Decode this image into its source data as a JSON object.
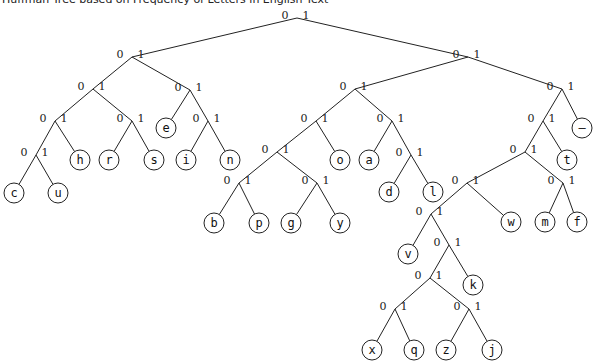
{
  "title": "Huffman Tree based on Frequency of Letters in English Text",
  "chart_data": {
    "type": "tree",
    "title": "Huffman Tree based on Frequency of Letters in English Text",
    "edge_labels": [
      "0",
      "1"
    ],
    "internal_nodes": [
      {
        "id": "root",
        "x": 297,
        "y": 18
      },
      {
        "id": "L",
        "x": 132,
        "y": 57
      },
      {
        "id": "R",
        "x": 468,
        "y": 57
      },
      {
        "id": "LL",
        "x": 93,
        "y": 89
      },
      {
        "id": "LR",
        "x": 190,
        "y": 90
      },
      {
        "id": "LLL",
        "x": 55,
        "y": 121
      },
      {
        "id": "LLR",
        "x": 132,
        "y": 121
      },
      {
        "id": "LLLL",
        "x": 36,
        "y": 155
      },
      {
        "id": "LRR",
        "x": 208,
        "y": 121
      },
      {
        "id": "RL",
        "x": 355,
        "y": 89
      },
      {
        "id": "RR",
        "x": 562,
        "y": 89
      },
      {
        "id": "RLL",
        "x": 316,
        "y": 121
      },
      {
        "id": "RLR",
        "x": 392,
        "y": 121
      },
      {
        "id": "RLLL",
        "x": 277,
        "y": 152
      },
      {
        "id": "RLLLL",
        "x": 239,
        "y": 183
      },
      {
        "id": "RLLLR",
        "x": 317,
        "y": 183
      },
      {
        "id": "RLRR",
        "x": 411,
        "y": 155
      },
      {
        "id": "RRL",
        "x": 543,
        "y": 121
      },
      {
        "id": "RRLL",
        "x": 525,
        "y": 152
      },
      {
        "id": "RRLLL",
        "x": 467,
        "y": 183
      },
      {
        "id": "RRLLR",
        "x": 563,
        "y": 183
      },
      {
        "id": "RRLLLL",
        "x": 431,
        "y": 214
      },
      {
        "id": "RRLLLLR",
        "x": 449,
        "y": 245
      },
      {
        "id": "RRLLLLRL",
        "x": 430,
        "y": 278
      },
      {
        "id": "RRLLLLRLL",
        "x": 395,
        "y": 309
      },
      {
        "id": "RRLLLLRLR",
        "x": 469,
        "y": 309
      }
    ],
    "leaves": [
      {
        "letter": "c",
        "code": "00000",
        "x": 14,
        "y": 193
      },
      {
        "letter": "u",
        "code": "00001",
        "x": 58,
        "y": 193
      },
      {
        "letter": "h",
        "code": "0001",
        "x": 80,
        "y": 160
      },
      {
        "letter": "r",
        "code": "0010",
        "x": 109,
        "y": 160
      },
      {
        "letter": "s",
        "code": "0011",
        "x": 154,
        "y": 160
      },
      {
        "letter": "e",
        "code": "010",
        "x": 166,
        "y": 128
      },
      {
        "letter": "i",
        "code": "0110",
        "x": 186,
        "y": 160
      },
      {
        "letter": "n",
        "code": "0111",
        "x": 230,
        "y": 160
      },
      {
        "letter": "b",
        "code": "100000",
        "x": 214,
        "y": 223
      },
      {
        "letter": "p",
        "code": "100001",
        "x": 259,
        "y": 223
      },
      {
        "letter": "g",
        "code": "100010",
        "x": 291,
        "y": 223
      },
      {
        "letter": "y",
        "code": "100011",
        "x": 340,
        "y": 223
      },
      {
        "letter": "o",
        "code": "1001",
        "x": 340,
        "y": 160
      },
      {
        "letter": "a",
        "code": "1010",
        "x": 369,
        "y": 160
      },
      {
        "letter": "d",
        "code": "10110",
        "x": 389,
        "y": 192
      },
      {
        "letter": "l",
        "code": "10111",
        "x": 433,
        "y": 192
      },
      {
        "letter": "v",
        "code": "110000",
        "x": 408,
        "y": 254
      },
      {
        "letter": "x",
        "code": "110001000",
        "x": 372,
        "y": 350
      },
      {
        "letter": "q",
        "code": "110001001",
        "x": 414,
        "y": 350
      },
      {
        "letter": "z",
        "code": "110001010",
        "x": 446,
        "y": 350
      },
      {
        "letter": "j",
        "code": "110001011",
        "x": 492,
        "y": 350
      },
      {
        "letter": "k",
        "code": "11000101",
        "x": 473,
        "y": 285
      },
      {
        "letter": "w",
        "code": "11001",
        "x": 511,
        "y": 222
      },
      {
        "letter": "m",
        "code": "11010",
        "x": 545,
        "y": 222
      },
      {
        "letter": "f",
        "code": "11011",
        "x": 577,
        "y": 222
      },
      {
        "letter": "t",
        "code": "1101",
        "x": 567,
        "y": 160
      },
      {
        "letter": "—",
        "code": "111",
        "x": 582,
        "y": 128
      }
    ],
    "edges": [
      [
        "root",
        "L"
      ],
      [
        "root",
        "R"
      ],
      [
        "L",
        "LL"
      ],
      [
        "L",
        "LR"
      ],
      [
        "LL",
        "LLL"
      ],
      [
        "LL",
        "LLR"
      ],
      [
        "LLL",
        "LLLL"
      ],
      [
        "LLL",
        "h"
      ],
      [
        "LLLL",
        "c"
      ],
      [
        "LLLL",
        "u"
      ],
      [
        "LLR",
        "r"
      ],
      [
        "LLR",
        "s"
      ],
      [
        "LR",
        "e"
      ],
      [
        "LR",
        "LRR"
      ],
      [
        "LRR",
        "i"
      ],
      [
        "LRR",
        "n"
      ],
      [
        "R",
        "RL"
      ],
      [
        "R",
        "RR"
      ],
      [
        "RL",
        "RLL"
      ],
      [
        "RL",
        "RLR"
      ],
      [
        "RLL",
        "RLLL"
      ],
      [
        "RLL",
        "o"
      ],
      [
        "RLLL",
        "RLLLL"
      ],
      [
        "RLLL",
        "RLLLR"
      ],
      [
        "RLLLL",
        "b"
      ],
      [
        "RLLLL",
        "p"
      ],
      [
        "RLLLR",
        "g"
      ],
      [
        "RLLLR",
        "y"
      ],
      [
        "RLR",
        "a"
      ],
      [
        "RLR",
        "RLRR"
      ],
      [
        "RLRR",
        "d"
      ],
      [
        "RLRR",
        "l"
      ],
      [
        "RR",
        "RRL"
      ],
      [
        "RR",
        "—"
      ],
      [
        "RRL",
        "RRLL"
      ],
      [
        "RRL",
        "t"
      ],
      [
        "RRLL",
        "RRLLL"
      ],
      [
        "RRLL",
        "RRLLR"
      ],
      [
        "RRLLL",
        "RRLLLL"
      ],
      [
        "RRLLL",
        "w"
      ],
      [
        "RRLLLL",
        "v"
      ],
      [
        "RRLLLL",
        "RRLLLLR"
      ],
      [
        "RRLLLLR",
        "RRLLLLRL"
      ],
      [
        "RRLLLLR",
        "k"
      ],
      [
        "RRLLLLRL",
        "RRLLLLRLL"
      ],
      [
        "RRLLLLRL",
        "RRLLLLRLR"
      ],
      [
        "RRLLLLRLL",
        "x"
      ],
      [
        "RRLLLLRLL",
        "q"
      ],
      [
        "RRLLLLRLR",
        "z"
      ],
      [
        "RRLLLLRLR",
        "j"
      ],
      [
        "RRLLR",
        "m"
      ],
      [
        "RRLLR",
        "f"
      ]
    ]
  }
}
